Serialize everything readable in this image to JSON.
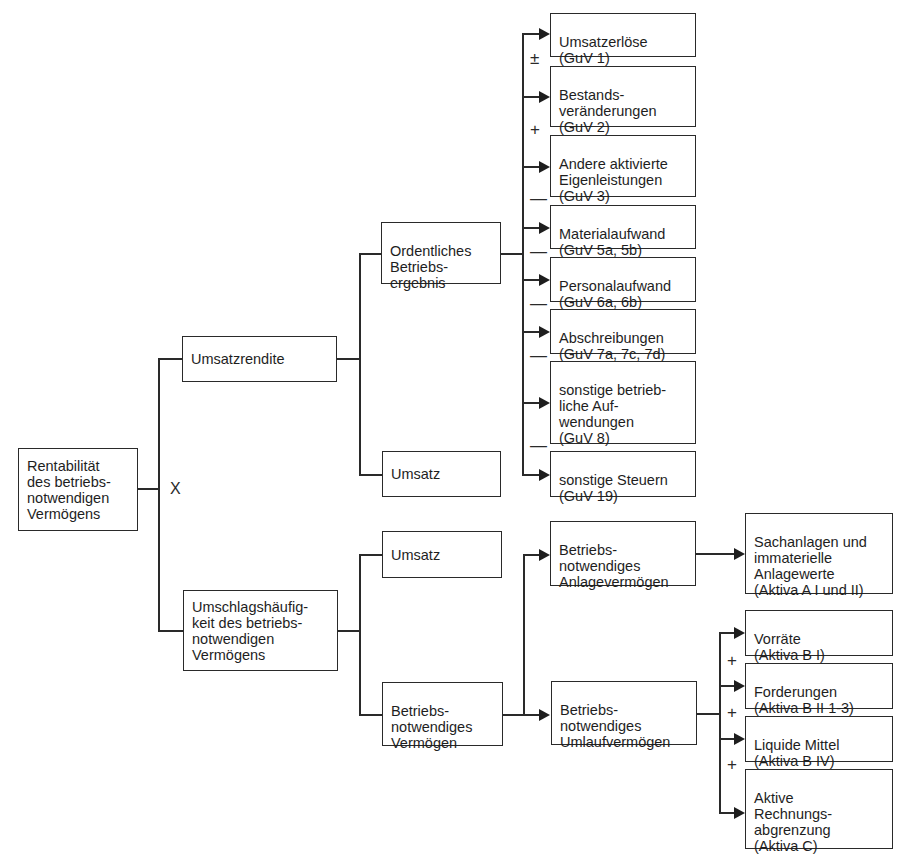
{
  "diagram": {
    "root": {
      "label": "Rentabilität\ndes betriebs-\nnotwendigen\nVermögens"
    },
    "operator_root": "X",
    "level1": [
      {
        "label": "Umsatzrendite"
      },
      {
        "label": "Umschlagshäufig-\nkeit des betriebs-\nnotwendigen\nVermögens"
      }
    ],
    "level2_upper": [
      {
        "label": "Ordentliches\nBetriebs-\nergebnis"
      },
      {
        "label": "Umsatz"
      }
    ],
    "level2_lower": [
      {
        "label": "Umsatz"
      },
      {
        "label": "Betriebs-\nnotwendiges\nVermögen"
      }
    ],
    "operating_result_items": [
      {
        "label": "Umsatzerlöse\n(GuV 1)"
      },
      {
        "label": "Bestands-\nveränderungen\n(GuV 2)"
      },
      {
        "label": "Andere aktivierte\nEigenleistungen\n(GuV 3)"
      },
      {
        "label": "Materialaufwand\n(GuV 5a, 5b)"
      },
      {
        "label": "Personalaufwand\n(GuV 6a, 6b)"
      },
      {
        "label": "Abschreibungen\n(GuV 7a, 7c, 7d)"
      },
      {
        "label": "sonstige betrieb-\nliche Auf-\nwendungen\n(GuV 8)"
      },
      {
        "label": "sonstige Steuern\n(GuV 19)"
      }
    ],
    "operating_result_signs": [
      "±",
      "+",
      "—",
      "—",
      "—",
      "—",
      "—"
    ],
    "assets_level3": [
      {
        "label": "Betriebs-\nnotwendiges\nAnlagevermögen"
      },
      {
        "label": "Betriebs-\nnotwendiges\nUmlaufvermögen"
      }
    ],
    "fixed_assets_item": {
      "label": "Sachanlagen und\nimmaterielle\nAnlagewerte\n(Aktiva A I und II)"
    },
    "current_assets_items": [
      {
        "label": "Vorräte\n(Aktiva B I)"
      },
      {
        "label": "Forderungen\n(Aktiva B II 1-3)"
      },
      {
        "label": "Liquide Mittel\n(Aktiva B IV)"
      },
      {
        "label": "Aktive\nRechnungs-\nabgrenzung\n(Aktiva C)"
      }
    ],
    "current_assets_signs": [
      "+",
      "+",
      "+"
    ]
  }
}
